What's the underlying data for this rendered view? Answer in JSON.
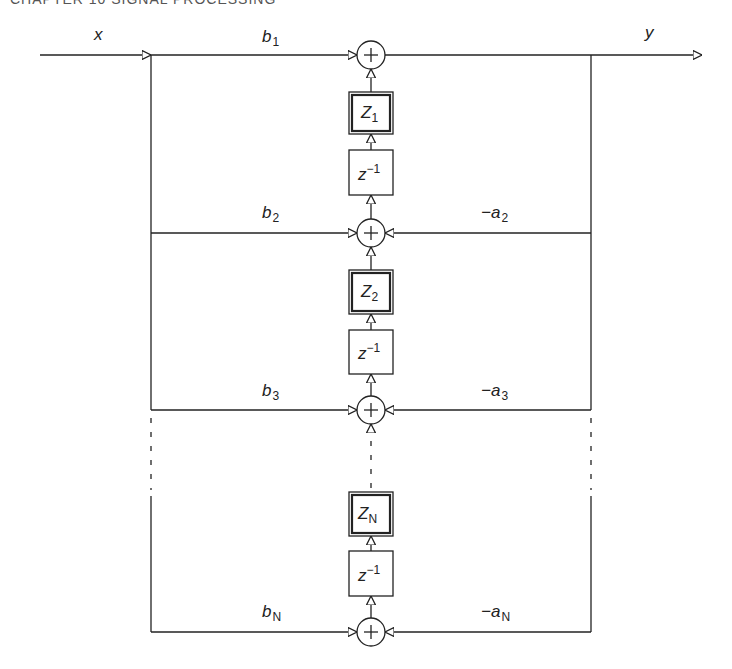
{
  "header": {
    "text": "CHAPTER 10   SIGNAL PROCESSING"
  },
  "diagram": {
    "input_label": "x",
    "output_label": "y",
    "stages": [
      {
        "id": 1,
        "b_coef": "b",
        "b_sub": "1",
        "a_coef": "",
        "a_sub": "",
        "state": "Z",
        "state_sub": "1"
      },
      {
        "id": 2,
        "b_coef": "b",
        "b_sub": "2",
        "a_coef": "−a",
        "a_sub": "2",
        "state": "Z",
        "state_sub": "2"
      },
      {
        "id": 3,
        "b_coef": "b",
        "b_sub": "3",
        "a_coef": "−a",
        "a_sub": "3",
        "state": "Z",
        "state_sub": "N"
      },
      {
        "id": "N",
        "b_coef": "b",
        "b_sub": "N",
        "a_coef": "−a",
        "a_sub": "N",
        "state": "",
        "state_sub": ""
      }
    ],
    "delay": {
      "base": "z",
      "exp": "−1"
    },
    "adder_symbol": "+",
    "line_color": "#222222"
  }
}
